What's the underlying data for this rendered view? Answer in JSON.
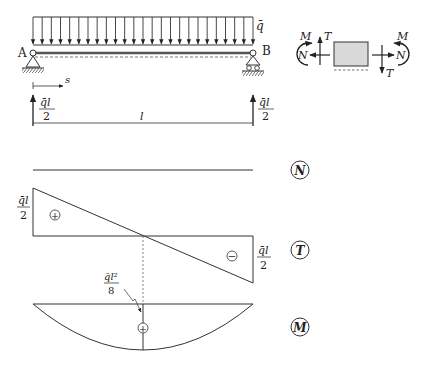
{
  "beam": {
    "load_label": "q̄",
    "support_left_label": "A",
    "support_right_label": "B",
    "coordinate_label": "s",
    "length_label": "l",
    "reaction_left": {
      "num": "q̄l",
      "den": "2"
    },
    "reaction_right": {
      "num": "q̄l",
      "den": "2"
    },
    "load_arrow_count": 25
  },
  "sign_convention": {
    "left_moment": "M",
    "left_normal": "N",
    "left_shear": "T",
    "right_moment": "M",
    "right_normal": "N",
    "right_shear": "T",
    "element_fill": "#d9d9d9"
  },
  "diagrams": {
    "N": {
      "badge": "N",
      "description": "zero axial force"
    },
    "T": {
      "badge": "T",
      "left_value": {
        "num": "q̄l",
        "den": "2"
      },
      "right_value": {
        "num": "q̄l",
        "den": "2"
      },
      "left_sign": "+",
      "right_sign": "−"
    },
    "M": {
      "badge": "M",
      "max_value": {
        "num": "q̄l²",
        "den": "8"
      },
      "sign": "+"
    }
  },
  "colors": {
    "line": "#333333",
    "text": "#222222",
    "background": "#ffffff"
  }
}
